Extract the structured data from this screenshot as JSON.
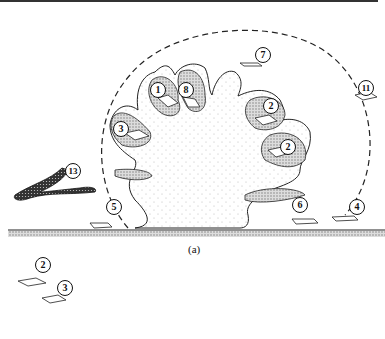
{
  "figure": {
    "caption": "(a)",
    "labels": [
      {
        "id": "1",
        "x": 157,
        "y": 89
      },
      {
        "id": "8",
        "x": 185,
        "y": 89
      },
      {
        "id": "7",
        "x": 262,
        "y": 54
      },
      {
        "id": "11",
        "x": 365,
        "y": 87
      },
      {
        "id": "2",
        "x": 270,
        "y": 105
      },
      {
        "id": "3",
        "x": 120,
        "y": 128
      },
      {
        "id": "2",
        "x": 287,
        "y": 146
      },
      {
        "id": "13",
        "x": 72,
        "y": 170
      },
      {
        "id": "5",
        "x": 113,
        "y": 206
      },
      {
        "id": "6",
        "x": 299,
        "y": 204
      },
      {
        "id": "4",
        "x": 356,
        "y": 206
      },
      {
        "id": "2",
        "x": 42,
        "y": 264
      },
      {
        "id": "3",
        "x": 64,
        "y": 287
      }
    ],
    "colors": {
      "ink": "#111111",
      "stipple": "#999999",
      "background": "#ffffff"
    }
  }
}
